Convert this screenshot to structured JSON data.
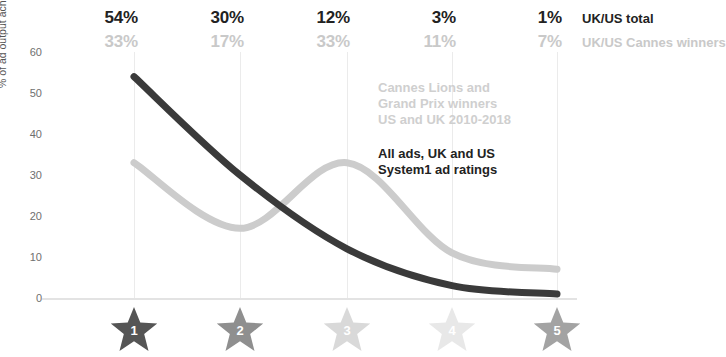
{
  "legend": {
    "total_name": "UK/US total",
    "cannes_name": "UK/US Cannes winners",
    "total_values": [
      "54%",
      "30%",
      "12%",
      "3%",
      "1%"
    ],
    "cannes_values": [
      "33%",
      "17%",
      "33%",
      "11%",
      "7%"
    ]
  },
  "annotations": {
    "cannes": "Cannes Lions and\nGrand Prix winners\nUS and UK 2010-2018",
    "all_ads": "All ads, UK and US\nSystem1 ad ratings"
  },
  "axis": {
    "y_title": "% of ad output achieving each Star rating",
    "y_ticks": [
      "60",
      "50",
      "40",
      "30",
      "20",
      "10",
      "0"
    ],
    "x_star_labels": [
      "1",
      "2",
      "3",
      "4",
      "5"
    ]
  },
  "colors": {
    "total_line": "#3a3a3a",
    "cannes_line": "#cccccc",
    "gridline": "#ebebeb",
    "star_1": "#555555",
    "star_2": "#8f8f8f",
    "star_3": "#d9d9d9",
    "star_4": "#e8e8e8",
    "star_5": "#a3a3a3"
  },
  "chart_data": {
    "type": "line",
    "title": "",
    "xlabel": "",
    "ylabel": "% of ad output achieving each Star rating",
    "categories": [
      "1",
      "2",
      "3",
      "4",
      "5"
    ],
    "ylim": [
      0,
      60
    ],
    "yticks": [
      0,
      10,
      20,
      30,
      40,
      50,
      60
    ],
    "grid": "vertical",
    "legend_position": "top-right",
    "series": [
      {
        "name": "UK/US total",
        "values": [
          54,
          30,
          12,
          3,
          1
        ],
        "color": "#3a3a3a"
      },
      {
        "name": "UK/US Cannes winners",
        "values": [
          33,
          17,
          33,
          11,
          7
        ],
        "color": "#cccccc"
      }
    ],
    "annotations": [
      "Cannes Lions and Grand Prix winners US and UK 2010-2018",
      "All ads, UK and US System1 ad ratings"
    ]
  }
}
